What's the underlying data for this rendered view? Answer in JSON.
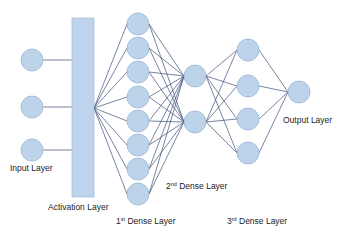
{
  "diagram": {
    "type": "neural-network-architecture",
    "colors": {
      "background": "#ffffff",
      "node_fill": "#bcd3ea",
      "node_stroke": "#9ab6d4",
      "bar_fill": "#bdd4ec",
      "bar_stroke": "#a6c0dc",
      "edge": "#3d4f78",
      "text": "#1c1c1c"
    },
    "input_layer": {
      "label": "Input Layer",
      "nodes": [
        {
          "x": 32,
          "y": 60
        },
        {
          "x": 32,
          "y": 107
        },
        {
          "x": 32,
          "y": 150
        }
      ]
    },
    "activation_layer": {
      "label": "Activation Layer",
      "bar": {
        "x": 72,
        "y": 18,
        "width": 22,
        "height": 179
      },
      "hub": {
        "x": 94,
        "y": 108
      }
    },
    "dense_layer_1": {
      "ordinal": "1",
      "suffix": "st",
      "label": " Dense Layer",
      "nodes": [
        {
          "x": 138,
          "y": 24
        },
        {
          "x": 138,
          "y": 48
        },
        {
          "x": 138,
          "y": 72
        },
        {
          "x": 138,
          "y": 97
        },
        {
          "x": 138,
          "y": 121
        },
        {
          "x": 138,
          "y": 145
        },
        {
          "x": 138,
          "y": 169
        },
        {
          "x": 138,
          "y": 194
        }
      ]
    },
    "dense_layer_2": {
      "ordinal": "2",
      "suffix": "nd",
      "label": " Dense Layer",
      "nodes": [
        {
          "x": 195,
          "y": 76
        },
        {
          "x": 195,
          "y": 122
        }
      ]
    },
    "dense_layer_3": {
      "ordinal": "3",
      "suffix": "rd",
      "label": " Dense Layer",
      "nodes": [
        {
          "x": 248,
          "y": 50
        },
        {
          "x": 248,
          "y": 86
        },
        {
          "x": 248,
          "y": 119
        },
        {
          "x": 248,
          "y": 153
        }
      ]
    },
    "output_layer": {
      "label": "Output Layer",
      "nodes": [
        {
          "x": 299,
          "y": 92
        }
      ]
    },
    "node_radius": 11
  }
}
